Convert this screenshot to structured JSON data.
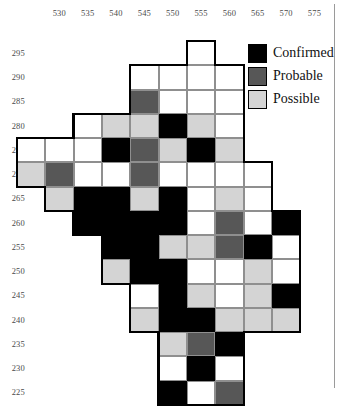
{
  "figure": {
    "type": "grid-map",
    "background_color": "#ffffff"
  },
  "axes": {
    "x_ticks": [
      "530",
      "535",
      "540",
      "545",
      "550",
      "555",
      "560",
      "565",
      "570",
      "575"
    ],
    "y_ticks": [
      "295",
      "290",
      "285",
      "280",
      "275",
      "270",
      "265",
      "260",
      "255",
      "250",
      "245",
      "240",
      "235",
      "230",
      "225"
    ],
    "x_tick_step": 5,
    "y_tick_step": 5,
    "x_range": [
      527.5,
      580
    ],
    "y_range": [
      222.5,
      297.5
    ]
  },
  "legend": {
    "items": [
      {
        "label": "Confirmed",
        "color": "#000000",
        "key": "confirmed"
      },
      {
        "label": "Probable",
        "color": "#575757",
        "key": "probable"
      },
      {
        "label": "Possible",
        "color": "#d4d4d4",
        "key": "possible"
      }
    ]
  },
  "chart_data": {
    "type": "heatmap",
    "title": "",
    "xlabel": "",
    "ylabel": "",
    "categories_x": [
      530,
      535,
      540,
      545,
      550,
      555,
      560,
      565,
      570,
      575
    ],
    "categories_y": [
      295,
      290,
      285,
      280,
      275,
      270,
      265,
      260,
      255,
      250,
      245,
      240,
      235,
      230,
      225
    ],
    "cell_states": [
      "empty",
      "possible",
      "probable",
      "confirmed"
    ],
    "state_colors": {
      "empty": "#ffffff",
      "possible": "#d4d4d4",
      "probable": "#575757",
      "confirmed": "#000000"
    },
    "grid": [
      {
        "y": 295,
        "cells": [
          {
            "x": 555,
            "state": "empty"
          }
        ]
      },
      {
        "y": 290,
        "cells": [
          {
            "x": 545,
            "state": "empty"
          },
          {
            "x": 550,
            "state": "empty"
          },
          {
            "x": 555,
            "state": "empty"
          },
          {
            "x": 560,
            "state": "empty"
          }
        ]
      },
      {
        "y": 285,
        "cells": [
          {
            "x": 545,
            "state": "probable"
          },
          {
            "x": 550,
            "state": "empty"
          },
          {
            "x": 555,
            "state": "empty"
          },
          {
            "x": 560,
            "state": "empty"
          }
        ]
      },
      {
        "y": 280,
        "cells": [
          {
            "x": 535,
            "state": "empty"
          },
          {
            "x": 540,
            "state": "possible"
          },
          {
            "x": 545,
            "state": "possible"
          },
          {
            "x": 550,
            "state": "confirmed"
          },
          {
            "x": 555,
            "state": "possible"
          },
          {
            "x": 560,
            "state": "empty"
          }
        ]
      },
      {
        "y": 275,
        "cells": [
          {
            "x": 525,
            "state": "empty"
          },
          {
            "x": 530,
            "state": "empty"
          },
          {
            "x": 535,
            "state": "empty"
          },
          {
            "x": 540,
            "state": "confirmed"
          },
          {
            "x": 545,
            "state": "probable"
          },
          {
            "x": 550,
            "state": "possible"
          },
          {
            "x": 555,
            "state": "confirmed"
          },
          {
            "x": 560,
            "state": "possible"
          }
        ]
      },
      {
        "y": 270,
        "cells": [
          {
            "x": 525,
            "state": "possible"
          },
          {
            "x": 530,
            "state": "probable"
          },
          {
            "x": 535,
            "state": "empty"
          },
          {
            "x": 540,
            "state": "empty"
          },
          {
            "x": 545,
            "state": "probable"
          },
          {
            "x": 550,
            "state": "empty"
          },
          {
            "x": 555,
            "state": "empty"
          },
          {
            "x": 560,
            "state": "empty"
          },
          {
            "x": 565,
            "state": "empty"
          }
        ]
      },
      {
        "y": 265,
        "cells": [
          {
            "x": 530,
            "state": "possible"
          },
          {
            "x": 535,
            "state": "confirmed"
          },
          {
            "x": 540,
            "state": "confirmed"
          },
          {
            "x": 545,
            "state": "possible"
          },
          {
            "x": 550,
            "state": "confirmed"
          },
          {
            "x": 555,
            "state": "empty"
          },
          {
            "x": 560,
            "state": "possible"
          },
          {
            "x": 565,
            "state": "empty"
          }
        ]
      },
      {
        "y": 260,
        "cells": [
          {
            "x": 535,
            "state": "confirmed"
          },
          {
            "x": 540,
            "state": "confirmed"
          },
          {
            "x": 545,
            "state": "confirmed"
          },
          {
            "x": 550,
            "state": "confirmed"
          },
          {
            "x": 555,
            "state": "empty"
          },
          {
            "x": 560,
            "state": "probable"
          },
          {
            "x": 565,
            "state": "empty"
          },
          {
            "x": 570,
            "state": "confirmed"
          }
        ]
      },
      {
        "y": 255,
        "cells": [
          {
            "x": 540,
            "state": "confirmed"
          },
          {
            "x": 545,
            "state": "confirmed"
          },
          {
            "x": 550,
            "state": "possible"
          },
          {
            "x": 555,
            "state": "possible"
          },
          {
            "x": 560,
            "state": "probable"
          },
          {
            "x": 565,
            "state": "confirmed"
          },
          {
            "x": 570,
            "state": "empty"
          }
        ]
      },
      {
        "y": 250,
        "cells": [
          {
            "x": 540,
            "state": "possible"
          },
          {
            "x": 545,
            "state": "confirmed"
          },
          {
            "x": 550,
            "state": "confirmed"
          },
          {
            "x": 555,
            "state": "empty"
          },
          {
            "x": 560,
            "state": "empty"
          },
          {
            "x": 565,
            "state": "possible"
          },
          {
            "x": 570,
            "state": "empty"
          }
        ]
      },
      {
        "y": 245,
        "cells": [
          {
            "x": 545,
            "state": "empty"
          },
          {
            "x": 550,
            "state": "confirmed"
          },
          {
            "x": 555,
            "state": "possible"
          },
          {
            "x": 560,
            "state": "empty"
          },
          {
            "x": 565,
            "state": "possible"
          },
          {
            "x": 570,
            "state": "confirmed"
          }
        ]
      },
      {
        "y": 240,
        "cells": [
          {
            "x": 545,
            "state": "possible"
          },
          {
            "x": 550,
            "state": "confirmed"
          },
          {
            "x": 555,
            "state": "confirmed"
          },
          {
            "x": 560,
            "state": "possible"
          },
          {
            "x": 565,
            "state": "possible"
          },
          {
            "x": 570,
            "state": "possible"
          }
        ]
      },
      {
        "y": 235,
        "cells": [
          {
            "x": 550,
            "state": "possible"
          },
          {
            "x": 555,
            "state": "probable"
          },
          {
            "x": 560,
            "state": "confirmed"
          }
        ]
      },
      {
        "y": 230,
        "cells": [
          {
            "x": 550,
            "state": "empty"
          },
          {
            "x": 555,
            "state": "confirmed"
          },
          {
            "x": 560,
            "state": "empty"
          }
        ]
      },
      {
        "y": 225,
        "cells": [
          {
            "x": 550,
            "state": "confirmed"
          },
          {
            "x": 555,
            "state": "empty"
          },
          {
            "x": 560,
            "state": "probable"
          }
        ]
      }
    ]
  }
}
